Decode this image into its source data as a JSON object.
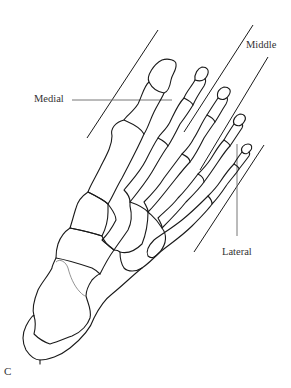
{
  "figure": {
    "panel_letter": "C",
    "labels": {
      "medial": "Medial",
      "middle": "Middle",
      "lateral": "Lateral"
    },
    "colors": {
      "bone_outline": "#1a1a1a",
      "leader_line": "#777777",
      "label_text": "#333333",
      "background": "#ffffff"
    }
  }
}
